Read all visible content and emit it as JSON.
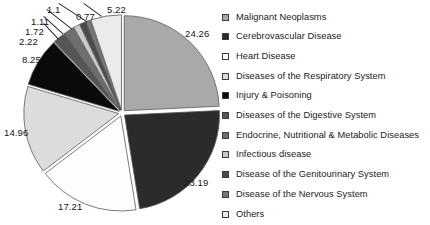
{
  "chart_data": {
    "type": "pie",
    "title": "",
    "subtitle": "",
    "xlabel": "",
    "ylabel": "",
    "legend_position": "right",
    "grid": false,
    "units": "percent",
    "start_angle_deg": 0,
    "direction": "clockwise",
    "exploded": true,
    "categories": [
      "Malignant Neoplasms",
      "Cerebrovascular Disease",
      "Heart Disease",
      "Diseases of the Respiratory System",
      "Injury & Poisoning",
      "Diseases of the Digestive System",
      "Endocrine, Nutritional & Metabolic Diseases",
      "Infectious disease",
      "Disease of the Genitourinary System",
      "Disease of the Nervous System",
      "Others"
    ],
    "values": [
      24.26,
      23.19,
      17.21,
      14.96,
      8.25,
      2.22,
      1.72,
      1.11,
      1.1,
      0.77,
      5.22
    ],
    "value_labels": [
      "24.26",
      "23.19",
      "17.21",
      "14.96",
      "8.25",
      "2.22",
      "1.72",
      "1.11",
      "1.1",
      "0.77",
      "5.22"
    ],
    "colors": [
      "#a9a9a9",
      "#2b2b2b",
      "#fdfdfd",
      "#dcdcdc",
      "#0a0a0a",
      "#555555",
      "#6e6e6e",
      "#c8c8c8",
      "#4a4a4a",
      "#777777",
      "#ebebeb"
    ],
    "slice_border_color": "#5a5a5a"
  },
  "legend": {
    "items": [
      {
        "label": "Malignant Neoplasms",
        "color": "#a9a9a9"
      },
      {
        "label": "Cerebrovascular Disease",
        "color": "#2b2b2b"
      },
      {
        "label": "Heart Disease",
        "color": "#fdfdfd"
      },
      {
        "label": "Diseases of the Respiratory System",
        "color": "#dcdcdc"
      },
      {
        "label": "Injury & Poisoning",
        "color": "#0a0a0a"
      },
      {
        "label": "Diseases of the Digestive System",
        "color": "#555555"
      },
      {
        "label": "Endocrine, Nutritional & Metabolic Diseases",
        "color": "#6e6e6e"
      },
      {
        "label": "Infectious disease",
        "color": "#c8c8c8"
      },
      {
        "label": "Disease of the Genitourinary System",
        "color": "#4a4a4a"
      },
      {
        "label": "Disease of the Nervous System",
        "color": "#777777"
      },
      {
        "label": "Others",
        "color": "#ebebeb"
      }
    ]
  },
  "labels": {
    "l_24_26": "24.26",
    "l_23_19": "23.19",
    "l_17_21": "17.21",
    "l_14_96": "14.96",
    "l_8_25": "8.25",
    "l_2_22": "2.22",
    "l_1_72": "1.72",
    "l_1_11": "1.11",
    "l_1_1": "1.1",
    "l_0_77": "0.77",
    "l_5_22": "5.22"
  }
}
